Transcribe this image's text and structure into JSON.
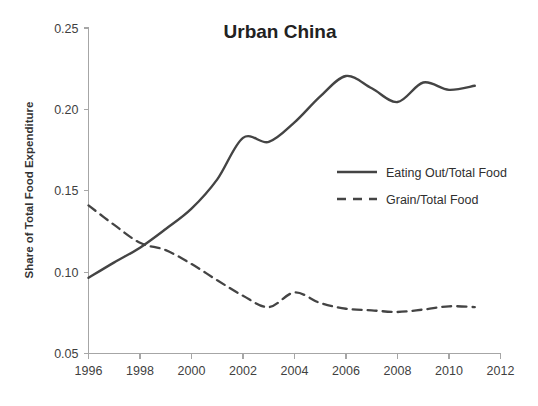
{
  "chart_data": {
    "type": "line",
    "title": "Urban China",
    "xlabel": "",
    "ylabel": "Share of Total Food Expenditure",
    "xlim": [
      1996,
      2012
    ],
    "ylim": [
      0.05,
      0.25
    ],
    "grid": false,
    "legend_position": "center-right",
    "x_ticks": [
      "1996",
      "1998",
      "2000",
      "2002",
      "2004",
      "2006",
      "2008",
      "2010",
      "2012"
    ],
    "x_tick_values": [
      1996,
      1998,
      2000,
      2002,
      2004,
      2006,
      2008,
      2010,
      2012
    ],
    "y_ticks": [
      "0.05",
      "0.10",
      "0.15",
      "0.20",
      "0.25"
    ],
    "y_tick_values": [
      0.05,
      0.1,
      0.15,
      0.2,
      0.25
    ],
    "x": [
      1996,
      1997,
      1998,
      1999,
      2000,
      2001,
      2002,
      2003,
      2004,
      2005,
      2006,
      2007,
      2008,
      2009,
      2010,
      2011
    ],
    "series": [
      {
        "name": "Eating Out/Total Food",
        "style": "solid",
        "color": "#444444",
        "values": [
          0.0965,
          0.106,
          0.115,
          0.1265,
          0.139,
          0.157,
          0.1825,
          0.18,
          0.192,
          0.208,
          0.2205,
          0.213,
          0.2045,
          0.2165,
          0.212,
          0.2145
        ]
      },
      {
        "name": "Grain/Total Food",
        "style": "dashed",
        "color": "#444444",
        "values": [
          0.141,
          0.129,
          0.118,
          0.1135,
          0.105,
          0.095,
          0.0855,
          0.0785,
          0.0875,
          0.081,
          0.0775,
          0.0765,
          0.0755,
          0.077,
          0.079,
          0.0785
        ]
      }
    ]
  },
  "axes": {
    "y_title": "Share of Total Food Expenditure"
  },
  "legend": {
    "entries": [
      {
        "label": "Eating Out/Total Food",
        "style": "solid"
      },
      {
        "label": "Grain/Total Food",
        "style": "dashed"
      }
    ]
  }
}
